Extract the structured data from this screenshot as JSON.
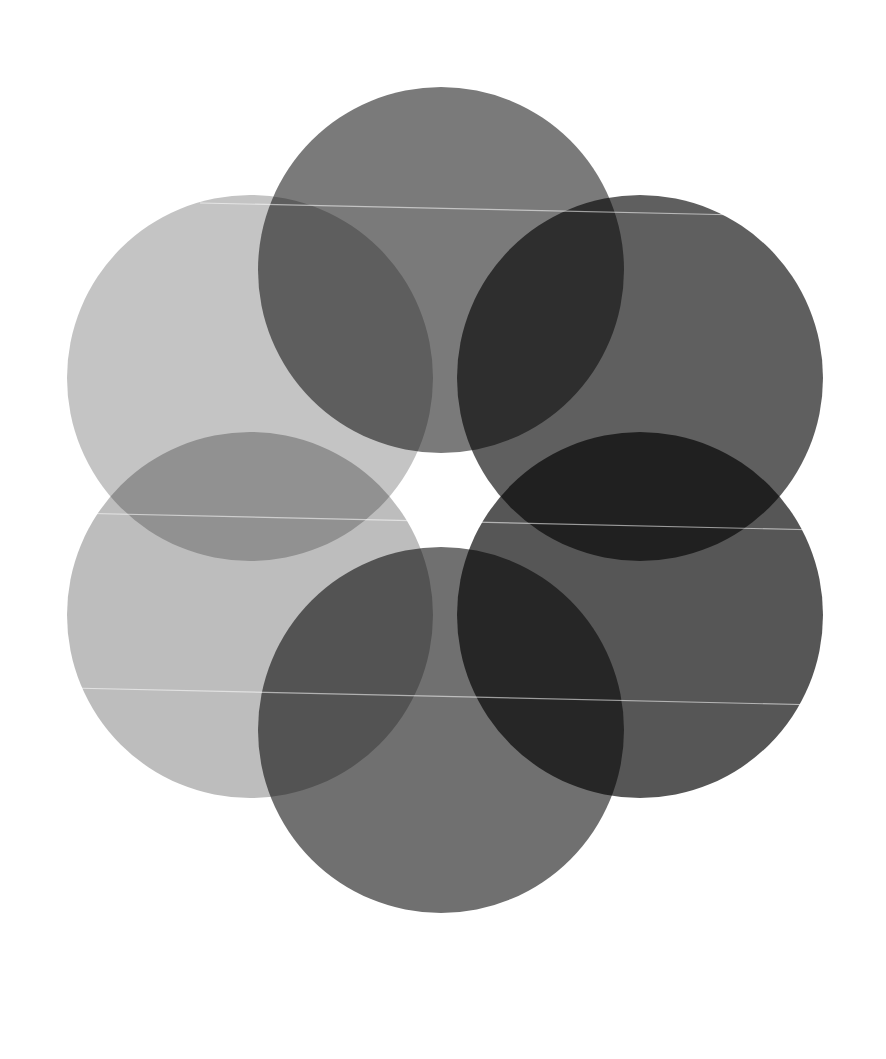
{
  "canvas": {
    "width": 886,
    "height": 1059,
    "background": "#ffffff"
  },
  "artwork": {
    "title": "Six overlapping translucent gray circles (rosette)",
    "radius": 183,
    "circles": [
      {
        "id": "top",
        "cx": 441,
        "cy": 270,
        "fill": "#7a7a7a"
      },
      {
        "id": "upper-left",
        "cx": 250,
        "cy": 378,
        "fill": "#c4c4c4"
      },
      {
        "id": "upper-right",
        "cx": 640,
        "cy": 378,
        "fill": "#5f5f5f"
      },
      {
        "id": "lower-left",
        "cx": 250,
        "cy": 615,
        "fill": "#bdbdbd"
      },
      {
        "id": "lower-right",
        "cx": 640,
        "cy": 615,
        "fill": "#565656"
      },
      {
        "id": "bottom",
        "cx": 441,
        "cy": 730,
        "fill": "#707070"
      }
    ],
    "scanlines": [
      {
        "x1": 200,
        "y1": 203,
        "x2": 740,
        "y2": 215
      },
      {
        "x1": 70,
        "y1": 513,
        "x2": 820,
        "y2": 530
      },
      {
        "x1": 70,
        "y1": 688,
        "x2": 820,
        "y2": 705
      }
    ],
    "center_hole_color": "#ffffff"
  }
}
